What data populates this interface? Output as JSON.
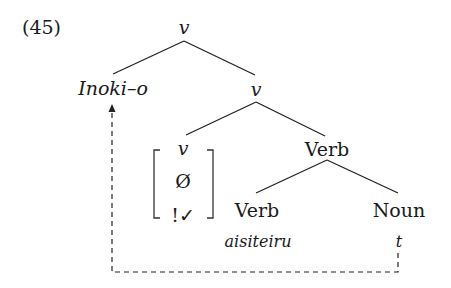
{
  "example_number": "(45)",
  "tree": {
    "root": {
      "label": "v"
    },
    "left_daughter": {
      "label": "Inoki–o"
    },
    "right_daughter": {
      "label": "v"
    },
    "bracket_node": {
      "rows": [
        "v",
        "Ø",
        "!✓"
      ]
    },
    "verb_phrase": {
      "label": "Verb"
    },
    "verb_leaf": {
      "label": "Verb",
      "word": "aisiteiru"
    },
    "noun_leaf": {
      "label": "Noun",
      "word": "t"
    }
  },
  "movement_arrow": {
    "from": "t",
    "to": "Inoki–o",
    "style": "dashed"
  }
}
